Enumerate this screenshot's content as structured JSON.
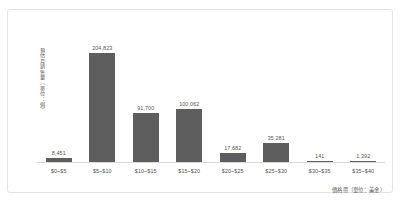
{
  "chart_data": {
    "type": "bar",
    "title": "",
    "subtitle": "",
    "xlabel": "價格帶（單位：美金）",
    "ylabel": "預估月銷售量（單位：個）",
    "categories": [
      "$0~$5",
      "$5~$10",
      "$10~$15",
      "$15~$20",
      "$20~$25",
      "$25~$30",
      "$30~$35",
      "$35~$40"
    ],
    "values": [
      8451,
      204823,
      91700,
      100062,
      17682,
      35281,
      141,
      1392
    ],
    "value_labels": [
      "8,451",
      "204,823",
      "91,700",
      "100,062",
      "17,682",
      "35,281",
      "141",
      "1,392"
    ],
    "ylim": [
      0,
      204823
    ],
    "grid": false,
    "legend": false,
    "legend_position": "none",
    "bar_color": "#5e5e5e",
    "axis_color": "#d9d9d9",
    "text_color": "#555555",
    "frame_color": "#e3e3e3",
    "background_color": "#ffffff"
  }
}
